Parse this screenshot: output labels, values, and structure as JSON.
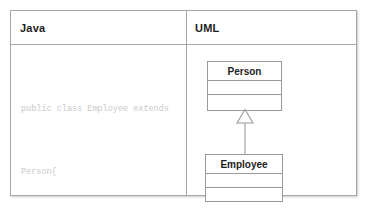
{
  "table": {
    "columns": [
      {
        "key": "java",
        "label": "Java"
      },
      {
        "key": "uml",
        "label": "UML"
      }
    ]
  },
  "java_panel": {
    "language": "Java",
    "code_lines": [
      "public class Employee extends",
      "Person{",
      "...",
      " }"
    ]
  },
  "uml_panel": {
    "classes": [
      {
        "name": "Person",
        "attributes": [],
        "operations": []
      },
      {
        "name": "Employee",
        "attributes": [],
        "operations": []
      }
    ],
    "relationship": {
      "type": "generalization",
      "label": "",
      "from": "Employee",
      "to": "Person",
      "arrowhead": "hollow-triangle"
    }
  },
  "colors": {
    "border": "#a8a8a8",
    "box_border": "#9a9a9a",
    "header_text": "#1d1d1d",
    "code_text": "#c9c9c9",
    "background": "#ffffff"
  }
}
